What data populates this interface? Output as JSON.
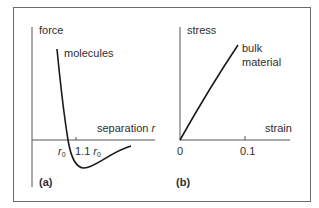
{
  "figure": {
    "frame_color": "#6a6a6a",
    "axis_color": "#555555",
    "curve_color": "#1a1a1a",
    "panel_a": {
      "tag": "(a)",
      "y_label": "force",
      "x_label_text": "separation ",
      "x_label_var": "r",
      "curve_label": "molecules",
      "tick_r0_base": "r",
      "tick_r0_sub": "0",
      "tick_11_prefix": "1.1 ",
      "tick_11_base": "r",
      "tick_11_sub": "0"
    },
    "panel_b": {
      "tag": "(b)",
      "y_label": "stress",
      "x_label": "strain",
      "curve_label_line1": "bulk",
      "curve_label_line2": "material",
      "tick_origin": "0",
      "tick_01": "0.1"
    }
  }
}
